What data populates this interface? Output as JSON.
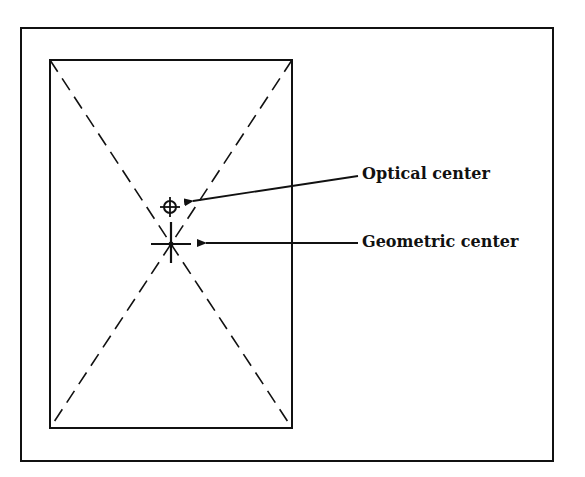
{
  "diagram": {
    "type": "optical-vs-geometric-center",
    "colors": {
      "ink": "#111111",
      "background": "#ffffff"
    },
    "outer_frame": {
      "x": 21,
      "y": 28,
      "width": 532,
      "height": 433
    },
    "inner_rect": {
      "x": 50,
      "y": 60,
      "width": 242,
      "height": 368
    },
    "geometric_center": {
      "x": 171,
      "y": 244
    },
    "optical_center": {
      "x": 170,
      "y": 207,
      "radius": 6
    },
    "labels": {
      "optical": "Optical center",
      "geometric": "Geometric center"
    }
  }
}
